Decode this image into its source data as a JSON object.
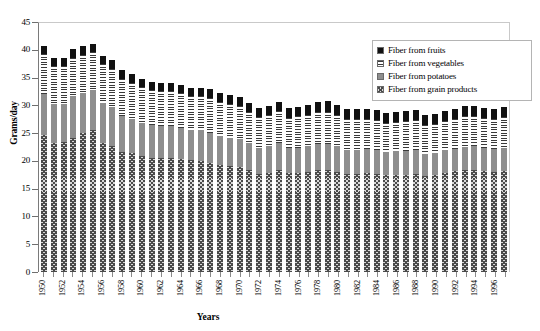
{
  "chart_data": {
    "type": "bar",
    "subtype": "stacked-bar",
    "title": "",
    "xlabel": "Years",
    "ylabel": "Grams/day",
    "ylim": [
      0,
      45
    ],
    "ytick_step": 5,
    "yticks": [
      "0",
      "5",
      "10",
      "15",
      "20",
      "25",
      "30",
      "35",
      "40",
      "45"
    ],
    "grid": false,
    "legend_position": "top-right",
    "x": [
      1950,
      1951,
      1952,
      1953,
      1954,
      1955,
      1956,
      1957,
      1958,
      1959,
      1960,
      1961,
      1962,
      1963,
      1964,
      1965,
      1966,
      1967,
      1968,
      1969,
      1970,
      1971,
      1972,
      1973,
      1974,
      1975,
      1976,
      1977,
      1978,
      1979,
      1980,
      1981,
      1982,
      1983,
      1984,
      1985,
      1986,
      1987,
      1988,
      1989,
      1990,
      1991,
      1992,
      1993,
      1994,
      1995,
      1996,
      1997
    ],
    "xtick_labels": [
      "1950",
      "",
      "1952",
      "",
      "1954",
      "",
      "1956",
      "",
      "1958",
      "",
      "1960",
      "",
      "1962",
      "",
      "1964",
      "",
      "1966",
      "",
      "1968",
      "",
      "1970",
      "",
      "1972",
      "",
      "1974",
      "",
      "1976",
      "",
      "1978",
      "",
      "1980",
      "",
      "1982",
      "",
      "1984",
      "",
      "1986",
      "",
      "1988",
      "",
      "1990",
      "",
      "1992",
      "",
      "1994",
      "",
      "1996",
      ""
    ],
    "series": [
      {
        "name": "Fiber from grain products",
        "pattern": "checkered",
        "color": "#4a4a4a",
        "values": [
          24.7,
          23.3,
          23.4,
          24.2,
          25.0,
          25.6,
          23.2,
          22.6,
          21.6,
          21.4,
          20.9,
          20.6,
          20.5,
          20.6,
          20.4,
          20.1,
          20.0,
          19.7,
          19.2,
          19.0,
          18.9,
          18.3,
          17.7,
          17.9,
          18.4,
          17.8,
          17.9,
          18.0,
          18.3,
          18.3,
          18.0,
          17.6,
          17.6,
          17.8,
          17.6,
          17.4,
          17.5,
          17.5,
          17.7,
          17.3,
          17.4,
          17.8,
          18.1,
          18.3,
          18.4,
          18.2,
          18.0,
          18.2
        ]
      },
      {
        "name": "Fiber from potatoes",
        "pattern": "solid-gray",
        "color": "#8e8e8e",
        "values": [
          7.4,
          7.0,
          6.8,
          7.4,
          7.2,
          7.1,
          7.2,
          7.1,
          6.5,
          6.1,
          6.0,
          5.8,
          5.8,
          5.7,
          5.6,
          5.5,
          5.5,
          5.4,
          5.3,
          5.2,
          5.1,
          4.9,
          4.7,
          4.7,
          4.8,
          4.5,
          4.5,
          4.6,
          4.7,
          4.7,
          4.6,
          4.4,
          4.4,
          4.3,
          4.3,
          4.2,
          4.2,
          4.2,
          4.2,
          4.0,
          4.0,
          4.1,
          4.1,
          4.2,
          4.2,
          4.1,
          4.1,
          4.2
        ]
      },
      {
        "name": "Fiber from vegetables",
        "pattern": "horizontal-stripes",
        "color": "#3a3a3a",
        "values": [
          7.2,
          6.8,
          6.9,
          7.0,
          6.9,
          6.9,
          7.0,
          6.9,
          6.7,
          6.5,
          6.4,
          6.3,
          6.3,
          6.3,
          6.2,
          6.1,
          6.2,
          6.2,
          6.1,
          6.0,
          5.9,
          5.6,
          5.5,
          5.6,
          5.7,
          5.5,
          5.6,
          5.7,
          5.8,
          5.8,
          5.7,
          5.5,
          5.5,
          5.4,
          5.4,
          5.3,
          5.3,
          5.4,
          5.4,
          5.2,
          5.2,
          5.3,
          5.4,
          5.5,
          5.5,
          5.4,
          5.4,
          5.5
        ]
      },
      {
        "name": "Fiber from fruits",
        "pattern": "solid-black",
        "color": "#111111",
        "values": [
          1.4,
          1.5,
          1.5,
          1.5,
          1.5,
          1.5,
          1.5,
          1.5,
          1.5,
          1.6,
          1.5,
          1.5,
          1.5,
          1.5,
          1.5,
          1.5,
          1.5,
          1.6,
          1.6,
          1.6,
          1.6,
          1.6,
          1.6,
          1.7,
          1.7,
          1.7,
          1.7,
          1.8,
          1.8,
          1.9,
          1.8,
          1.8,
          1.8,
          1.8,
          1.8,
          1.8,
          1.8,
          1.8,
          1.8,
          1.8,
          1.8,
          1.8,
          1.8,
          1.8,
          1.8,
          1.8,
          1.8,
          1.8
        ]
      }
    ],
    "totals": [
      40.7,
      38.6,
      38.6,
      40.1,
      40.6,
      41.1,
      38.9,
      38.1,
      36.3,
      35.6,
      34.8,
      34.2,
      34.1,
      34.1,
      33.7,
      33.2,
      33.2,
      32.9,
      32.2,
      31.8,
      31.5,
      30.4,
      29.5,
      29.9,
      30.6,
      29.5,
      29.7,
      30.1,
      30.6,
      30.7,
      30.1,
      29.3,
      29.3,
      29.3,
      29.1,
      28.7,
      28.8,
      28.9,
      29.1,
      28.3,
      28.4,
      29.0,
      29.4,
      29.8,
      29.9,
      29.5,
      29.3,
      29.7
    ]
  },
  "legend": {
    "items": [
      {
        "label": "Fiber from fruits",
        "swatch": "solid-black-swatch"
      },
      {
        "label": "Fiber from vegetables",
        "swatch": "horizontal-stripe-swatch"
      },
      {
        "label": "Fiber from potatoes",
        "swatch": "solid-gray-swatch"
      },
      {
        "label": "Fiber from grain products",
        "swatch": "checkered-swatch"
      }
    ]
  }
}
